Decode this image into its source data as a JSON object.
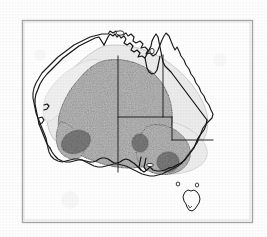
{
  "figure": {
    "kind": "distribution-map",
    "region": "Australia",
    "title": "",
    "caption": "",
    "background_color": "#fefefe",
    "frame": {
      "name": "figure-border",
      "color": "#a8a8a8",
      "line_width": 1.4,
      "x": 22,
      "y": 20,
      "width": 230,
      "height": 202
    }
  },
  "map": {
    "coastline": {
      "label": "Australia coastline",
      "stroke": "#1d1d1d",
      "stroke_width": 1.1,
      "fill": "#ffffff"
    },
    "tasmania": {
      "label": "Tasmania",
      "stroke": "#1d1d1d",
      "stroke_width": 1.0,
      "fill": "#ffffff"
    },
    "islands": [
      {
        "label": "Kangaroo Island"
      },
      {
        "label": "Melville Island"
      },
      {
        "label": "Groote Eylandt"
      },
      {
        "label": "King Island"
      },
      {
        "label": "Flinders Island"
      }
    ],
    "state_borders": {
      "label": "State and territory boundaries",
      "stroke": "#1d1d1d",
      "stroke_width": 0.9,
      "segments": [
        "WA / NT - SA vertical at 129E",
        "NT / QLD vertical at 138E",
        "NT / SA horizontal at 26S",
        "QLD / NSW horizontal at 29S",
        "SA / NSW - VIC vertical at 141E"
      ]
    }
  },
  "distribution": {
    "legend_note": "Shaded zones show distribution density",
    "zones": [
      {
        "name": "outer-range",
        "label": "Outer range (sparse)",
        "color": "#e9e9e9",
        "stroke": "#b6b6b6",
        "density": "low"
      },
      {
        "name": "core-range",
        "label": "Core range (stippled)",
        "color": "#9d9d9d",
        "stroke": "#3a3a3a",
        "density": "medium"
      },
      {
        "name": "concentration-blobs",
        "label": "High concentration centres",
        "color": "#5e5e5e",
        "stroke": "#2c2c2c",
        "density": "high",
        "count": 3,
        "centres": [
          {
            "label": "south-west centre",
            "cx": 76,
            "cy": 142,
            "rx": 15,
            "ry": 11,
            "rotate": -22
          },
          {
            "label": "central-south centre",
            "cx": 140,
            "cy": 143,
            "rx": 8,
            "ry": 9,
            "rotate": -10
          },
          {
            "label": "south-east centre",
            "cx": 168,
            "cy": 162,
            "rx": 11,
            "ry": 10,
            "rotate": -8
          }
        ]
      }
    ]
  }
}
